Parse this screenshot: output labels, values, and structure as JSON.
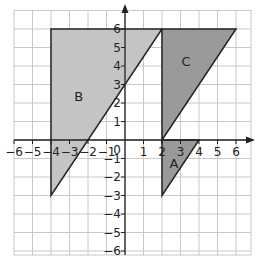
{
  "diagram": {
    "type": "coordinate-grid-transformations",
    "axes": {
      "x_ticks": [
        "-6",
        "-5",
        "-4",
        "-3",
        "-2",
        "-1",
        "0",
        "1",
        "2",
        "3",
        "4",
        "5",
        "6"
      ],
      "y_ticks": [
        "6",
        "5",
        "4",
        "3",
        "2",
        "1",
        "-1",
        "-2",
        "-3",
        "-4",
        "-5",
        "-6"
      ],
      "origin_label": "0"
    },
    "colors": {
      "grid": "#c8c8c8",
      "axis": "#222222",
      "shape_b": "#c4c4c4",
      "shape_ac": "#9a9a9a",
      "outline": "#222222"
    },
    "shapes": [
      {
        "label": "A",
        "vertices": [
          [
            2,
            0
          ],
          [
            4,
            0
          ],
          [
            2,
            -3
          ]
        ]
      },
      {
        "label": "B",
        "vertices": [
          [
            -4,
            6
          ],
          [
            2,
            6
          ],
          [
            -4,
            -3
          ]
        ]
      },
      {
        "label": "C",
        "vertices": [
          [
            2,
            6
          ],
          [
            6,
            6
          ],
          [
            2,
            0
          ]
        ]
      }
    ]
  }
}
